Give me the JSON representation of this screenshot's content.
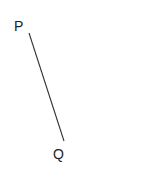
{
  "diagram": {
    "points": [
      {
        "label": "P",
        "x": 29,
        "y": 33,
        "label_x": 14,
        "label_y": 31
      },
      {
        "label": "Q",
        "x": 64,
        "y": 141,
        "label_x": 53,
        "label_y": 159
      }
    ],
    "segments": [
      {
        "from": "P",
        "to": "Q",
        "color": "#333333"
      }
    ]
  }
}
